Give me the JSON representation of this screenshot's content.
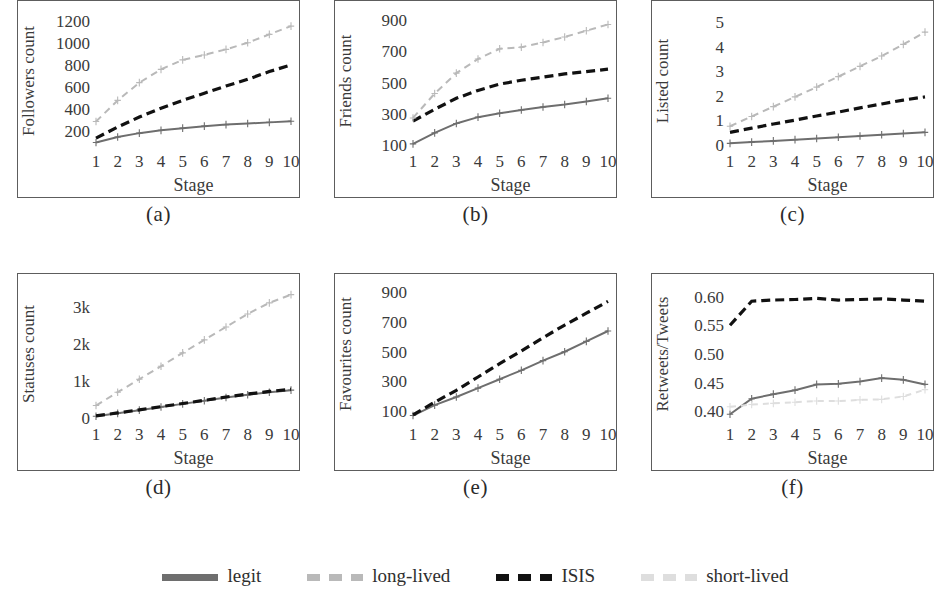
{
  "figure": {
    "panel_captions": [
      "(a)",
      "(b)",
      "(c)",
      "(d)",
      "(e)",
      "(f)"
    ],
    "xlabel": "Stage"
  },
  "legend": {
    "position": "bottom-center",
    "items": [
      {
        "label": "legit",
        "color": "#6e6e6e",
        "style": "solid",
        "key": "legit"
      },
      {
        "label": "long-lived",
        "color": "#b9b9b9",
        "style": "dashed",
        "key": "long_lived"
      },
      {
        "label": "ISIS",
        "color": "#111111",
        "style": "dashed",
        "key": "isis"
      },
      {
        "label": "short-lived",
        "color": "#dedede",
        "style": "dashed",
        "key": "short_lived"
      }
    ]
  },
  "colors": {
    "legit": "#6e6e6e",
    "long_lived": "#b9b9b9",
    "isis": "#111111",
    "short_lived": "#dedede",
    "axis": "#5d5d5d",
    "text": "#2e2e2e"
  },
  "chart_data": [
    {
      "id": "a",
      "type": "line",
      "title": "",
      "caption": "(a)",
      "xlabel": "Stage",
      "ylabel": "Followers count",
      "x": [
        1,
        2,
        3,
        4,
        5,
        6,
        7,
        8,
        9,
        10
      ],
      "xticks": [
        1,
        2,
        3,
        4,
        5,
        6,
        7,
        8,
        9,
        10
      ],
      "yticks": [
        200,
        400,
        600,
        800,
        1000,
        1200
      ],
      "ytick_labels": [
        "200",
        "400",
        "600",
        "800",
        "1000",
        "1200"
      ],
      "ylim": [
        60,
        1250
      ],
      "grid": false,
      "series": [
        {
          "name": "legit",
          "values": [
            100,
            150,
            185,
            210,
            230,
            248,
            262,
            272,
            282,
            292
          ]
        },
        {
          "name": "ISIS",
          "values": [
            140,
            240,
            330,
            410,
            480,
            545,
            610,
            670,
            740,
            800
          ]
        },
        {
          "name": "long-lived",
          "values": [
            290,
            480,
            640,
            760,
            845,
            890,
            940,
            1000,
            1075,
            1150
          ]
        }
      ]
    },
    {
      "id": "b",
      "type": "line",
      "caption": "(b)",
      "xlabel": "Stage",
      "ylabel": "Friends count",
      "x": [
        1,
        2,
        3,
        4,
        5,
        6,
        7,
        8,
        9,
        10
      ],
      "xticks": [
        1,
        2,
        3,
        4,
        5,
        6,
        7,
        8,
        9,
        10
      ],
      "yticks": [
        100,
        300,
        500,
        700,
        900
      ],
      "ytick_labels": [
        "100",
        "300",
        "500",
        "700",
        "900"
      ],
      "ylim": [
        90,
        930
      ],
      "grid": false,
      "series": [
        {
          "name": "legit",
          "values": [
            110,
            180,
            240,
            280,
            305,
            325,
            345,
            360,
            380,
            400
          ]
        },
        {
          "name": "ISIS",
          "values": [
            255,
            330,
            400,
            450,
            490,
            515,
            535,
            555,
            570,
            585
          ]
        },
        {
          "name": "long-lived",
          "values": [
            275,
            430,
            560,
            650,
            715,
            725,
            755,
            790,
            830,
            870
          ]
        }
      ]
    },
    {
      "id": "c",
      "type": "line",
      "caption": "(c)",
      "xlabel": "Stage",
      "ylabel": "Listed count",
      "x": [
        1,
        2,
        3,
        4,
        5,
        6,
        7,
        8,
        9,
        10
      ],
      "xticks": [
        1,
        2,
        3,
        4,
        5,
        6,
        7,
        8,
        9,
        10
      ],
      "yticks": [
        0,
        1,
        2,
        3,
        4,
        5
      ],
      "ytick_labels": [
        "0",
        "1",
        "2",
        "3",
        "4",
        "5"
      ],
      "ylim": [
        -0.1,
        5.3
      ],
      "grid": false,
      "series": [
        {
          "name": "legit",
          "values": [
            0.05,
            0.1,
            0.15,
            0.2,
            0.25,
            0.3,
            0.35,
            0.4,
            0.45,
            0.5
          ]
        },
        {
          "name": "ISIS",
          "values": [
            0.5,
            0.67,
            0.84,
            1.0,
            1.17,
            1.33,
            1.5,
            1.66,
            1.82,
            1.95
          ]
        },
        {
          "name": "long-lived",
          "values": [
            0.75,
            1.15,
            1.55,
            1.95,
            2.35,
            2.78,
            3.2,
            3.62,
            4.1,
            4.6
          ]
        }
      ]
    },
    {
      "id": "d",
      "type": "line",
      "caption": "(d)",
      "xlabel": "Stage",
      "ylabel": "Statuses count",
      "x": [
        1,
        2,
        3,
        4,
        5,
        6,
        7,
        8,
        9,
        10
      ],
      "xticks": [
        1,
        2,
        3,
        4,
        5,
        6,
        7,
        8,
        9,
        10
      ],
      "yticks": [
        0,
        1000,
        2000,
        3000
      ],
      "ytick_labels": [
        "0",
        "1k",
        "2k",
        "3k"
      ],
      "ylim": [
        -60,
        3500
      ],
      "grid": false,
      "series": [
        {
          "name": "legit",
          "values": [
            40,
            120,
            205,
            290,
            375,
            460,
            545,
            620,
            690,
            745
          ]
        },
        {
          "name": "ISIS",
          "values": [
            50,
            130,
            215,
            300,
            385,
            470,
            560,
            640,
            710,
            770
          ]
        },
        {
          "name": "long-lived",
          "values": [
            330,
            690,
            1040,
            1390,
            1750,
            2100,
            2450,
            2800,
            3100,
            3320
          ]
        }
      ]
    },
    {
      "id": "e",
      "type": "line",
      "caption": "(e)",
      "xlabel": "Stage",
      "ylabel": "Favourites count",
      "x": [
        1,
        2,
        3,
        4,
        5,
        6,
        7,
        8,
        9,
        10
      ],
      "xticks": [
        1,
        2,
        3,
        4,
        5,
        6,
        7,
        8,
        9,
        10
      ],
      "yticks": [
        100,
        300,
        500,
        700,
        900
      ],
      "ytick_labels": [
        "100",
        "300",
        "500",
        "700",
        "900"
      ],
      "ylim": [
        40,
        930
      ],
      "grid": false,
      "series": [
        {
          "name": "legit",
          "values": [
            70,
            140,
            195,
            255,
            315,
            375,
            440,
            500,
            570,
            640
          ]
        },
        {
          "name": "ISIS",
          "values": [
            75,
            160,
            240,
            330,
            420,
            505,
            595,
            680,
            760,
            840
          ]
        }
      ]
    },
    {
      "id": "f",
      "type": "line",
      "caption": "(f)",
      "xlabel": "Stage",
      "ylabel": "Retweets/Tweets",
      "x": [
        1,
        2,
        3,
        4,
        5,
        6,
        7,
        8,
        9,
        10
      ],
      "xticks": [
        1,
        2,
        3,
        4,
        5,
        6,
        7,
        8,
        9,
        10
      ],
      "yticks": [
        0.4,
        0.45,
        0.5,
        0.55,
        0.6
      ],
      "ytick_labels": [
        "0.40",
        "0.45",
        "0.50",
        "0.55",
        "0.60"
      ],
      "ylim": [
        0.385,
        0.615
      ],
      "grid": false,
      "series": [
        {
          "name": "legit",
          "values": [
            0.395,
            0.422,
            0.43,
            0.437,
            0.447,
            0.448,
            0.452,
            0.458,
            0.455,
            0.447
          ]
        },
        {
          "name": "ISIS",
          "values": [
            0.55,
            0.592,
            0.594,
            0.595,
            0.597,
            0.594,
            0.595,
            0.596,
            0.594,
            0.592
          ]
        },
        {
          "name": "short-lived",
          "values": [
            0.408,
            0.412,
            0.414,
            0.416,
            0.418,
            0.418,
            0.42,
            0.421,
            0.426,
            0.438
          ]
        }
      ]
    }
  ]
}
